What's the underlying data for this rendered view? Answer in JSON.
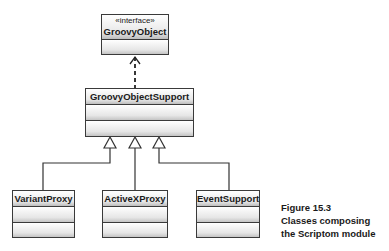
{
  "diagram": {
    "type": "uml-class-diagram",
    "classes": [
      {
        "name": "GroovyObject",
        "stereotype": "«interface»"
      },
      {
        "name": "GroovyObjectSupport"
      },
      {
        "name": "VariantProxy"
      },
      {
        "name": "ActiveXProxy"
      },
      {
        "name": "EventSupport"
      }
    ],
    "relations": [
      {
        "from": "GroovyObjectSupport",
        "to": "GroovyObject",
        "kind": "realization"
      },
      {
        "from": "VariantProxy",
        "to": "GroovyObjectSupport",
        "kind": "generalization"
      },
      {
        "from": "ActiveXProxy",
        "to": "GroovyObjectSupport",
        "kind": "generalization"
      },
      {
        "from": "EventSupport",
        "to": "GroovyObjectSupport",
        "kind": "generalization"
      }
    ]
  },
  "caption": {
    "figure": "Figure 15.3",
    "line1": "Classes composing",
    "line2": "the Scriptom module"
  },
  "colors": {
    "line": "#3a3a3a",
    "text": "#1a1a1a"
  }
}
